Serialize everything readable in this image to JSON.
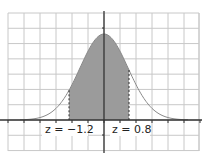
{
  "chart_data": {
    "type": "area",
    "title": "",
    "xlabel": "",
    "ylabel": "",
    "distribution": "standard normal",
    "mean": 0,
    "sd": 1,
    "shaded_region": {
      "from": -1.2,
      "to": 0.8
    },
    "annotations": [
      {
        "text": "z = −1.2",
        "x": -1.2
      },
      {
        "text": "z = 0.8",
        "x": 0.8
      }
    ],
    "grid": true,
    "grid_x_step": 0.5,
    "xlim": [
      -3.0,
      3.0
    ],
    "colors": {
      "fill": "#9b9b9b",
      "curve": "#8a8a8a",
      "grid": "#c8c8c8",
      "axis": "#333333"
    }
  },
  "labels": {
    "left": "z = −1.2",
    "right": "z = 0.8"
  }
}
